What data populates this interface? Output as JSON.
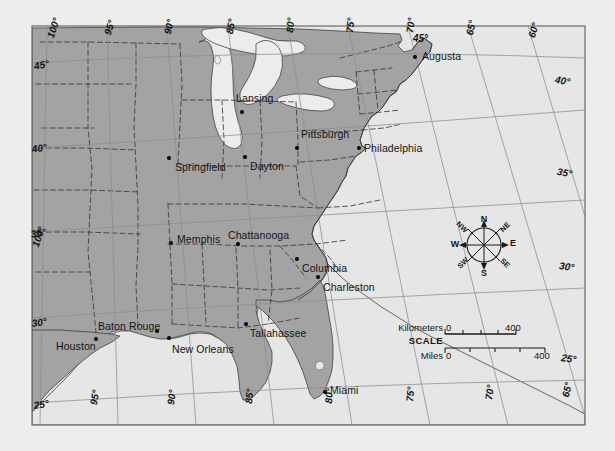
{
  "map": {
    "title": "Eastern United States reference map",
    "colors": {
      "page_background": "#ededec",
      "land": "#a3a3a3",
      "water": "#e9e9e9",
      "ocean": "#e6e6e6",
      "graticule": "#8f8f8f",
      "state_border": "#3a3a3a",
      "coastline": "#303030",
      "text": "#141414",
      "frame": "#6a6a6a"
    },
    "cities": [
      {
        "name": "Augusta",
        "dot_x": 415,
        "dot_y": 57,
        "label_x": 422,
        "label_y": 50,
        "anchor": "left"
      },
      {
        "name": "Lansing",
        "dot_x": 242,
        "dot_y": 112,
        "label_x": 236,
        "label_y": 92,
        "anchor": "left"
      },
      {
        "name": "Pittsburgh",
        "dot_x": 297,
        "dot_y": 148,
        "label_x": 301,
        "label_y": 128,
        "anchor": "left"
      },
      {
        "name": "Philadelphia",
        "dot_x": 359,
        "dot_y": 148,
        "label_x": 364,
        "label_y": 142,
        "anchor": "left"
      },
      {
        "name": "Springfield",
        "dot_x": 169,
        "dot_y": 158,
        "label_x": 175,
        "label_y": 161,
        "anchor": "left"
      },
      {
        "name": "Dayton",
        "dot_x": 245,
        "dot_y": 157,
        "label_x": 250,
        "label_y": 160,
        "anchor": "left"
      },
      {
        "name": "Memphis",
        "dot_x": 171,
        "dot_y": 243,
        "label_x": 177,
        "label_y": 233,
        "anchor": "left"
      },
      {
        "name": "Chattanooga",
        "dot_x": 238,
        "dot_y": 244,
        "label_x": 228,
        "label_y": 229,
        "anchor": "left"
      },
      {
        "name": "Columbia",
        "dot_x": 297,
        "dot_y": 259,
        "label_x": 302,
        "label_y": 262,
        "anchor": "left"
      },
      {
        "name": "Charleston",
        "dot_x": 318,
        "dot_y": 277,
        "label_x": 323,
        "label_y": 281,
        "anchor": "left"
      },
      {
        "name": "Baton Rouge",
        "dot_x": 157,
        "dot_y": 331,
        "label_x": 98,
        "label_y": 320,
        "anchor": "left"
      },
      {
        "name": "Houston",
        "dot_x": 96,
        "dot_y": 339,
        "label_x": 56,
        "label_y": 340,
        "anchor": "left"
      },
      {
        "name": "New Orleans",
        "dot_x": 169,
        "dot_y": 338,
        "label_x": 172,
        "label_y": 343,
        "anchor": "left"
      },
      {
        "name": "Tallahassee",
        "dot_x": 246,
        "dot_y": 324,
        "label_x": 250,
        "label_y": 327,
        "anchor": "left"
      },
      {
        "name": "Miami",
        "dot_x": 325,
        "dot_y": 392,
        "label_x": 330,
        "label_y": 384,
        "anchor": "left"
      }
    ],
    "graticule_labels_top": [
      {
        "text": "100°",
        "x": 45,
        "y": 36,
        "rot": -72
      },
      {
        "text": "95°",
        "x": 102,
        "y": 33,
        "rot": -72
      },
      {
        "text": "90°",
        "x": 162,
        "y": 33,
        "rot": -78
      },
      {
        "text": "85°",
        "x": 224,
        "y": 33,
        "rot": -80
      },
      {
        "text": "80°",
        "x": 284,
        "y": 32,
        "rot": -84
      },
      {
        "text": "75°",
        "x": 344,
        "y": 32,
        "rot": -84
      },
      {
        "text": "70°",
        "x": 404,
        "y": 32,
        "rot": -82
      },
      {
        "text": "65°",
        "x": 464,
        "y": 34,
        "rot": -78
      },
      {
        "text": "60°",
        "x": 526,
        "y": 36,
        "rot": -74
      }
    ],
    "graticule_labels_bottom": [
      {
        "text": "95°",
        "x": 88,
        "y": 404,
        "rot": -80
      },
      {
        "text": "90°",
        "x": 165,
        "y": 404,
        "rot": -82
      },
      {
        "text": "85°",
        "x": 243,
        "y": 403,
        "rot": -84
      },
      {
        "text": "80°",
        "x": 323,
        "y": 403,
        "rot": -86
      },
      {
        "text": "75°",
        "x": 404,
        "y": 401,
        "rot": -84
      },
      {
        "text": "70°",
        "x": 483,
        "y": 399,
        "rot": -82
      },
      {
        "text": "65°",
        "x": 560,
        "y": 396,
        "rot": -78
      }
    ],
    "graticule_labels_left": [
      {
        "text": "45°",
        "x": 33,
        "y": 61,
        "rot": -12
      },
      {
        "text": "40°",
        "x": 31,
        "y": 144,
        "rot": -10
      },
      {
        "text": "35°",
        "x": 30,
        "y": 229,
        "rot": -10
      },
      {
        "text": "100°",
        "x": 30,
        "y": 245,
        "rot": -72
      },
      {
        "text": "30°",
        "x": 31,
        "y": 318,
        "rot": -8
      },
      {
        "text": "25°",
        "x": 33,
        "y": 400,
        "rot": -8
      }
    ],
    "graticule_labels_right": [
      {
        "text": "40°",
        "x": 556,
        "y": 74,
        "rot": 10
      },
      {
        "text": "35°",
        "x": 558,
        "y": 166,
        "rot": 10
      },
      {
        "text": "30°",
        "x": 560,
        "y": 260,
        "rot": 8
      },
      {
        "text": "25°",
        "x": 562,
        "y": 352,
        "rot": 8
      }
    ],
    "graticule_label_45_top": {
      "text": "45°",
      "x": 413,
      "y": 33
    },
    "compass": {
      "center_x": 484,
      "center_y": 245,
      "directions": [
        {
          "label": "N",
          "x": 484,
          "y": 219,
          "size": "lg"
        },
        {
          "label": "NE",
          "x": 505,
          "y": 227,
          "size": "sm"
        },
        {
          "label": "E",
          "x": 513,
          "y": 243,
          "size": "lg"
        },
        {
          "label": "SE",
          "x": 505,
          "y": 263,
          "size": "sm"
        },
        {
          "label": "S",
          "x": 484,
          "y": 273,
          "size": "lg"
        },
        {
          "label": "SW",
          "x": 463,
          "y": 263,
          "size": "sm"
        },
        {
          "label": "W",
          "x": 455,
          "y": 244,
          "size": "lg"
        },
        {
          "label": "NW",
          "x": 462,
          "y": 227,
          "size": "sm"
        }
      ]
    },
    "scale": {
      "title": "SCALE",
      "km_label": "Kilometers",
      "km_zero": "0",
      "km_max": "400",
      "mi_label": "Miles",
      "mi_zero": "0",
      "mi_max": "400"
    }
  }
}
